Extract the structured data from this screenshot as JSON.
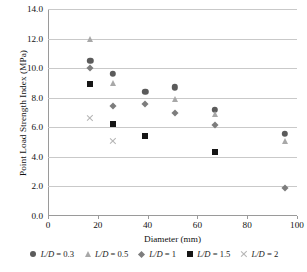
{
  "chart_data": {
    "type": "scatter",
    "title": "",
    "xlabel": "Diameter (mm)",
    "ylabel": "Point Load Strength Index (MPa)",
    "xlim": [
      0,
      100
    ],
    "ylim": [
      0,
      14
    ],
    "xticks": [
      "0",
      "20",
      "40",
      "60",
      "80",
      "100"
    ],
    "xtick_values": [
      0,
      20,
      40,
      60,
      80,
      100
    ],
    "yticks": [
      "0.0",
      "2.0",
      "4.0",
      "6.0",
      "8.0",
      "10.0",
      "12.0",
      "14.0"
    ],
    "ytick_values": [
      0,
      2,
      4,
      6,
      8,
      10,
      12,
      14
    ],
    "grid": "horizontal",
    "legend_position": "bottom",
    "series": [
      {
        "name": "L/D = 0.3",
        "marker": "circle",
        "color": "#5b5b5b",
        "points": [
          {
            "x": 17,
            "y": 10.5
          },
          {
            "x": 26,
            "y": 9.6
          },
          {
            "x": 39,
            "y": 8.4
          },
          {
            "x": 51,
            "y": 8.7
          },
          {
            "x": 67,
            "y": 7.2
          },
          {
            "x": 95,
            "y": 5.55
          }
        ]
      },
      {
        "name": "L/D = 0.5",
        "marker": "triangle",
        "color": "#a8a8a8",
        "points": [
          {
            "x": 17,
            "y": 12.0
          },
          {
            "x": 26,
            "y": 9.0
          },
          {
            "x": 51,
            "y": 7.9
          },
          {
            "x": 67,
            "y": 6.9
          },
          {
            "x": 95,
            "y": 5.05
          }
        ]
      },
      {
        "name": "L/D = 1",
        "marker": "diamond",
        "color": "#7d7d7d",
        "points": [
          {
            "x": 17,
            "y": 10.0
          },
          {
            "x": 26,
            "y": 7.45
          },
          {
            "x": 39,
            "y": 7.55
          },
          {
            "x": 51,
            "y": 7.0
          },
          {
            "x": 67,
            "y": 6.15
          },
          {
            "x": 95,
            "y": 1.9
          }
        ]
      },
      {
        "name": "L/D = 1.5",
        "marker": "square",
        "color": "#161616",
        "points": [
          {
            "x": 17,
            "y": 8.9
          },
          {
            "x": 26,
            "y": 6.2
          },
          {
            "x": 39,
            "y": 5.4
          },
          {
            "x": 67,
            "y": 4.3
          }
        ]
      },
      {
        "name": "L/D = 2",
        "marker": "cross",
        "color": "#b4b4b4",
        "points": [
          {
            "x": 17,
            "y": 6.65
          },
          {
            "x": 26,
            "y": 5.1
          }
        ]
      }
    ]
  },
  "axes": {
    "y_title": "Point Load Strength Index (MPa)",
    "x_title": "Diameter (mm)"
  },
  "legend": {
    "items": [
      {
        "label_prefix": "L/D",
        "label_suffix": " = 0.3",
        "marker": "circle-marker-icon"
      },
      {
        "label_prefix": "L/D",
        "label_suffix": " = 0.5",
        "marker": "triangle-marker-icon"
      },
      {
        "label_prefix": "L/D",
        "label_suffix": " = 1",
        "marker": "diamond-marker-icon"
      },
      {
        "label_prefix": "L/D",
        "label_suffix": " = 1.5",
        "marker": "square-marker-icon"
      },
      {
        "label_prefix": "L/D",
        "label_suffix": " = 2",
        "marker": "cross-marker-icon"
      }
    ]
  }
}
